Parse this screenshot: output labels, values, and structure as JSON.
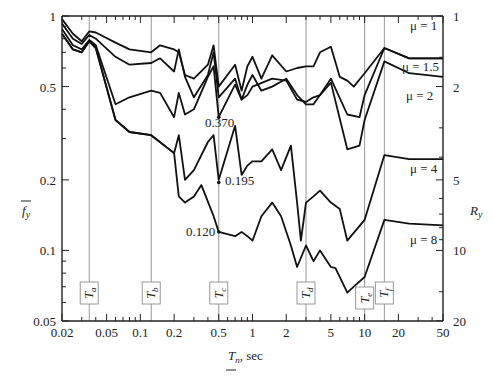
{
  "chart_data": {
    "type": "line",
    "title": "",
    "xlabel": "T_n, sec",
    "ylabel": "f̄_y",
    "ylabel_right": "R_y",
    "xscale": "log",
    "yscale": "log",
    "xlim": [
      0.02,
      50
    ],
    "ylim": [
      0.05,
      1
    ],
    "x_ticks": [
      "0.02",
      "0.05",
      "0.1",
      "0.2",
      "0.5",
      "1",
      "2",
      "5",
      "10",
      "20",
      "50"
    ],
    "x_tick_values": [
      0.02,
      0.05,
      0.1,
      0.2,
      0.5,
      1,
      2,
      5,
      10,
      20,
      50
    ],
    "y_ticks": [
      "0.05",
      "0.1",
      "0.2",
      "0.5",
      "1"
    ],
    "y_tick_values": [
      0.05,
      0.1,
      0.2,
      0.5,
      1
    ],
    "y_right_ticks": [
      "1",
      "2",
      "5",
      "10",
      "20"
    ],
    "y_right_tick_values": [
      1,
      0.5,
      0.2,
      0.1,
      0.05
    ],
    "period_markers": [
      {
        "label": "T_a",
        "sub": "a",
        "x": 0.035
      },
      {
        "label": "T_b",
        "sub": "b",
        "x": 0.125
      },
      {
        "label": "T_c",
        "sub": "c",
        "x": 0.5
      },
      {
        "label": "T_d",
        "sub": "d",
        "x": 3.0
      },
      {
        "label": "T_e",
        "sub": "e",
        "x": 10.0
      },
      {
        "label": "T_f",
        "sub": "f",
        "x": 15.0
      }
    ],
    "annotations": [
      {
        "text": "0.370",
        "x": 0.5,
        "y": 0.37
      },
      {
        "text": "0.195",
        "x": 0.5,
        "y": 0.195
      },
      {
        "text": "0.120",
        "x": 0.5,
        "y": 0.12
      }
    ],
    "series": [
      {
        "name": "μ = 1",
        "x": [
          0.02,
          0.025,
          0.03,
          0.035,
          0.04,
          0.06,
          0.08,
          0.125,
          0.15,
          0.2,
          0.22,
          0.25,
          0.3,
          0.4,
          0.45,
          0.5,
          0.7,
          0.8,
          0.9,
          1.0,
          1.2,
          1.5,
          2.0,
          2.5,
          3.0,
          3.5,
          4.0,
          5.0,
          6.0,
          7.0,
          8.0,
          10.0,
          15.0,
          25.0,
          50.0
        ],
        "y": [
          0.97,
          0.84,
          0.78,
          0.86,
          0.85,
          0.77,
          0.72,
          0.7,
          0.75,
          0.72,
          0.7,
          0.56,
          0.54,
          0.62,
          0.75,
          0.5,
          0.62,
          0.48,
          0.61,
          0.67,
          0.54,
          0.68,
          0.58,
          0.6,
          0.61,
          0.61,
          0.7,
          0.74,
          0.55,
          0.53,
          0.5,
          0.57,
          0.73,
          0.66,
          0.66
        ]
      },
      {
        "name": "μ = 1.5",
        "x": [
          0.02,
          0.025,
          0.03,
          0.035,
          0.04,
          0.06,
          0.08,
          0.125,
          0.15,
          0.2,
          0.22,
          0.25,
          0.3,
          0.4,
          0.45,
          0.5,
          0.7,
          0.8,
          0.9,
          1.0,
          1.2,
          1.5,
          2.0,
          2.5,
          3.0,
          3.5,
          4.0,
          5.0,
          7.0,
          9.0,
          10.0,
          15.0,
          25.0,
          50.0
        ],
        "y": [
          0.93,
          0.8,
          0.76,
          0.83,
          0.8,
          0.67,
          0.62,
          0.63,
          0.66,
          0.58,
          0.72,
          0.55,
          0.45,
          0.56,
          0.7,
          0.45,
          0.54,
          0.44,
          0.51,
          0.56,
          0.48,
          0.5,
          0.54,
          0.46,
          0.42,
          0.42,
          0.46,
          0.54,
          0.38,
          0.37,
          0.46,
          0.73,
          0.66,
          0.66
        ]
      },
      {
        "name": "μ = 2",
        "x": [
          0.02,
          0.025,
          0.03,
          0.035,
          0.04,
          0.06,
          0.08,
          0.125,
          0.15,
          0.2,
          0.22,
          0.25,
          0.3,
          0.4,
          0.45,
          0.5,
          0.7,
          0.8,
          0.9,
          1.0,
          1.5,
          2.0,
          2.5,
          3.0,
          3.5,
          4.0,
          5.0,
          7.0,
          9.0,
          10.0,
          15.0,
          25.0,
          50.0
        ],
        "y": [
          0.88,
          0.75,
          0.72,
          0.79,
          0.75,
          0.42,
          0.45,
          0.48,
          0.47,
          0.37,
          0.47,
          0.38,
          0.4,
          0.55,
          0.61,
          0.37,
          0.51,
          0.44,
          0.46,
          0.5,
          0.54,
          0.53,
          0.44,
          0.43,
          0.45,
          0.46,
          0.52,
          0.27,
          0.28,
          0.36,
          0.64,
          0.57,
          0.55
        ]
      },
      {
        "name": "μ = 4",
        "x": [
          0.02,
          0.025,
          0.03,
          0.035,
          0.04,
          0.06,
          0.08,
          0.125,
          0.2,
          0.22,
          0.25,
          0.3,
          0.4,
          0.45,
          0.5,
          0.7,
          0.8,
          0.9,
          1.0,
          1.2,
          1.5,
          1.8,
          2.2,
          2.5,
          2.7,
          3.0,
          3.5,
          4.0,
          5.0,
          6.0,
          7.0,
          10.0,
          15.0,
          25.0,
          50.0
        ],
        "y": [
          0.84,
          0.72,
          0.7,
          0.78,
          0.73,
          0.36,
          0.32,
          0.31,
          0.26,
          0.31,
          0.2,
          0.22,
          0.29,
          0.31,
          0.2,
          0.34,
          0.21,
          0.23,
          0.24,
          0.24,
          0.27,
          0.22,
          0.28,
          0.16,
          0.11,
          0.16,
          0.17,
          0.18,
          0.16,
          0.15,
          0.11,
          0.135,
          0.255,
          0.245,
          0.245
        ]
      },
      {
        "name": "μ = 8",
        "x": [
          0.02,
          0.025,
          0.03,
          0.035,
          0.04,
          0.06,
          0.08,
          0.125,
          0.2,
          0.22,
          0.25,
          0.3,
          0.35,
          0.45,
          0.5,
          0.7,
          0.8,
          0.9,
          1.0,
          1.2,
          1.5,
          1.8,
          2.2,
          2.5,
          3.0,
          3.5,
          4.0,
          5.0,
          5.5,
          7.0,
          8.0,
          10.0,
          15.0,
          25.0,
          50.0
        ],
        "y": [
          0.84,
          0.72,
          0.7,
          0.78,
          0.73,
          0.36,
          0.32,
          0.31,
          0.26,
          0.17,
          0.16,
          0.17,
          0.19,
          0.14,
          0.12,
          0.115,
          0.12,
          0.115,
          0.11,
          0.14,
          0.16,
          0.14,
          0.105,
          0.085,
          0.105,
          0.09,
          0.1,
          0.085,
          0.084,
          0.066,
          0.07,
          0.077,
          0.135,
          0.13,
          0.128
        ]
      }
    ],
    "series_labels": [
      {
        "text": "μ = 1",
        "x": 28,
        "y": 0.96
      },
      {
        "text": "μ = 1.5",
        "x": 28,
        "y": 0.7
      },
      {
        "text": "μ = 2",
        "x": 28,
        "y": 0.6
      },
      {
        "text": "μ = 4",
        "x": 28,
        "y": 0.22
      },
      {
        "text": "μ = 8",
        "x": 28,
        "y": 0.115
      }
    ]
  },
  "labels": {
    "y_left": "f",
    "y_left_sub": "y",
    "y_right": "R",
    "y_right_sub": "y",
    "x_main": "T",
    "x_sub": "n",
    "x_unit": ", sec"
  }
}
